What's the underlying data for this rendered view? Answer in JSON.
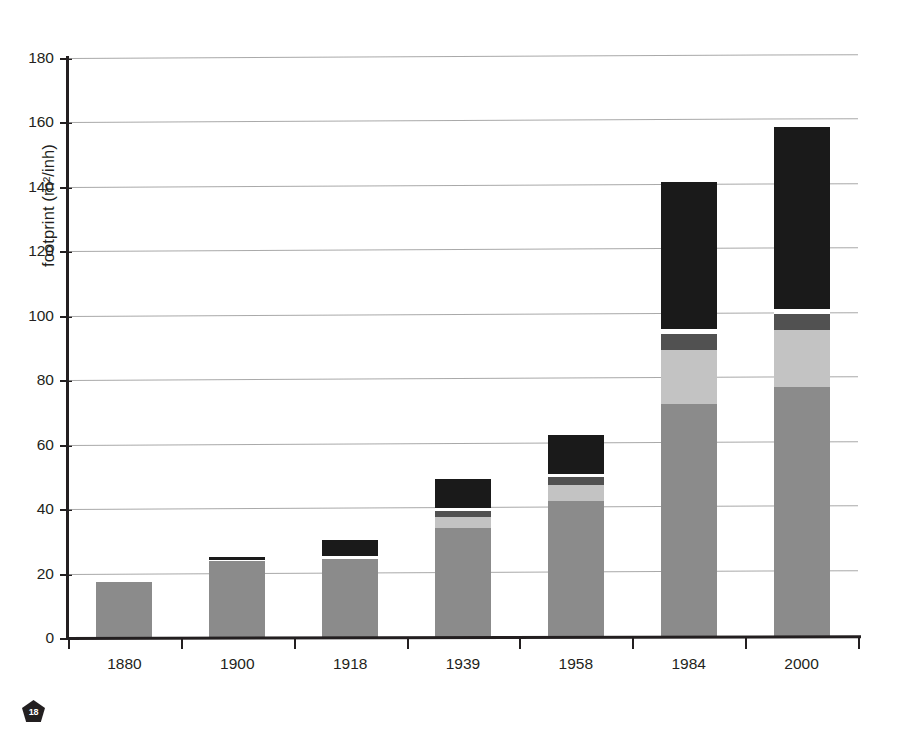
{
  "figure": {
    "badge_label": "18",
    "badge_name": "page-number-badge"
  },
  "chart_data": {
    "type": "bar",
    "subtype": "stacked-bar",
    "title": "",
    "subtitle": "",
    "xlabel": "",
    "ylabel": "footprint (m²/inh)",
    "ylabel_note": "left edge of label is clipped by the page margin in the scan",
    "categories": [
      "1880",
      "1900",
      "1918",
      "1939",
      "1958",
      "1984",
      "2000"
    ],
    "ylim": [
      0,
      180
    ],
    "yticks": [
      0,
      20,
      40,
      60,
      80,
      100,
      120,
      140,
      160,
      180
    ],
    "ytick_labels": [
      "0",
      "20",
      "40",
      "60",
      "80",
      "100",
      "120",
      "140",
      "160",
      "180"
    ],
    "grid": true,
    "grid_axis": "y",
    "legend": false,
    "legend_position": "none",
    "stack_order": "bottom-to-top",
    "series": [
      {
        "name": "segment-1-medium-gray",
        "color": "#8b8b8b",
        "values": [
          17.5,
          23.8,
          24.5,
          34.0,
          42.5,
          72.5,
          78.0
        ]
      },
      {
        "name": "segment-2-light-gray",
        "color": "#c3c3c3",
        "values": [
          0,
          0,
          0,
          3.5,
          5.0,
          17.0,
          17.5
        ]
      },
      {
        "name": "segment-3-dark-gray",
        "color": "#515151",
        "values": [
          0,
          0,
          0,
          2.0,
          2.5,
          5.0,
          5.0
        ]
      },
      {
        "name": "segment-4-white-gap",
        "color": "#ffffff",
        "values": [
          0,
          0.5,
          0.8,
          0.8,
          1.0,
          1.5,
          1.5
        ]
      },
      {
        "name": "segment-5-black",
        "color": "#1a1a1a",
        "values": [
          0,
          0.7,
          5.2,
          9.0,
          12.0,
          45.5,
          56.5
        ]
      }
    ],
    "totals": [
      17.5,
      25.0,
      30.5,
      49.3,
      63.0,
      141.5,
      158.5
    ]
  },
  "colors": {
    "axis": "#231f20",
    "grid": "#9a9a9a",
    "text": "#231f20",
    "background": "#ffffff"
  }
}
